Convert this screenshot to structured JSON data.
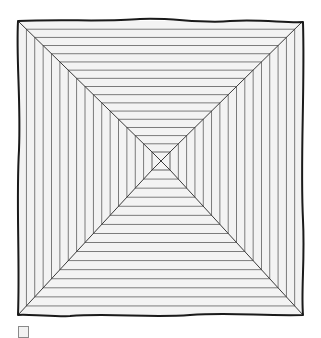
{
  "illustration": {
    "subject": "concentric-squares-pyramid-top-view",
    "background_color": "#ffffff",
    "fill_color": "#f3f3f3",
    "line_color": "#6e6e6e",
    "frame_color": "#1a1a1a",
    "diagonal_color": "#3a3a3a",
    "outer_frame": {
      "x1": 18,
      "y1": 21,
      "x2": 303,
      "y2": 315
    },
    "inner_square": {
      "x1": 152,
      "y1": 152,
      "x2": 170,
      "y2": 170
    },
    "ring_count": 16
  },
  "thumbnail_icon": {
    "name": "square-thumbnail-icon"
  }
}
